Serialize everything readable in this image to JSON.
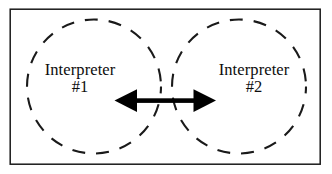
{
  "diagram": {
    "frame": {
      "shape": "rectangle",
      "stroke_color": "#1a1a1a",
      "fill_color": "#ffffff",
      "stroke_width": 1.4
    },
    "nodes": [
      {
        "id": "interpreter-1",
        "name_label": "Interpreter",
        "number_label": "#1",
        "shape": "dashed-circle",
        "stroke_color": "#1a1a1a"
      },
      {
        "id": "interpreter-2",
        "name_label": "Interpreter",
        "number_label": "#2",
        "shape": "dashed-circle",
        "stroke_color": "#1a1a1a"
      }
    ],
    "connector": {
      "type": "double-headed-arrow",
      "direction": "bidirectional",
      "label": "",
      "color": "#000000"
    }
  }
}
